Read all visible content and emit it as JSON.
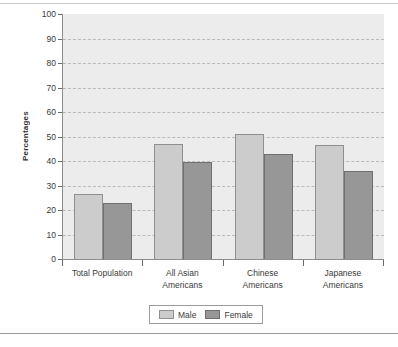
{
  "chart_data": {
    "type": "bar",
    "title": "",
    "xlabel": "",
    "ylabel": "Percentages",
    "ylim": [
      0,
      100
    ],
    "ytick_step": 10,
    "yticks": [
      100,
      90,
      80,
      70,
      60,
      50,
      40,
      30,
      20,
      10,
      0
    ],
    "grid": true,
    "grid_style": "dashed-horizontal",
    "legend_position": "bottom-center",
    "categories": [
      "Total Population",
      "All Asian Americans",
      "Chinese Americans",
      "Japanese Americans"
    ],
    "category_lines": [
      [
        "Total Population"
      ],
      [
        "All Asian",
        "Americans"
      ],
      [
        "Chinese",
        "Americans"
      ],
      [
        "Japanese",
        "Americans"
      ]
    ],
    "series": [
      {
        "name": "Male",
        "color": "#cccccc",
        "values": [
          26.5,
          47,
          51,
          46.5
        ]
      },
      {
        "name": "Female",
        "color": "#979797",
        "values": [
          23,
          39.5,
          43,
          36
        ]
      }
    ]
  },
  "legend": {
    "items": [
      {
        "label": "Male",
        "swatch": "male"
      },
      {
        "label": "Female",
        "swatch": "female"
      }
    ]
  },
  "colors": {
    "plot_background": "#ececec",
    "axis": "#8d8d8d",
    "gridline": "#b9b9b9",
    "male_bar": "#cccccc",
    "female_bar": "#979797",
    "text": "#3a3a3a"
  }
}
